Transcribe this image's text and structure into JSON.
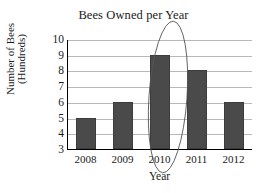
{
  "chart_data": {
    "type": "bar",
    "title": "Bees Owned per Year",
    "xlabel": "Year",
    "ylabel": "Number of Bees (Hundreds)",
    "ylabel_lines": [
      "Number of Bees",
      "(Hundreds)"
    ],
    "categories": [
      "2008",
      "2009",
      "2010",
      "2011",
      "2012"
    ],
    "values": [
      5,
      6,
      9,
      8,
      6
    ],
    "yticks": [
      10,
      9,
      8,
      7,
      6,
      5,
      4,
      3
    ],
    "ylim": [
      3,
      10
    ],
    "grid": "horizontal",
    "legend": "none",
    "bar_color": "#4a4a4a",
    "gridline_color": "#b8b8b8",
    "axis_color": "#000000",
    "background_color": "#ffffff",
    "annotations": [
      {
        "name": "circled-2010-bar",
        "shape": "ellipse",
        "style": "hand-drawn",
        "target_category": "2010",
        "color": "#555555"
      }
    ]
  }
}
